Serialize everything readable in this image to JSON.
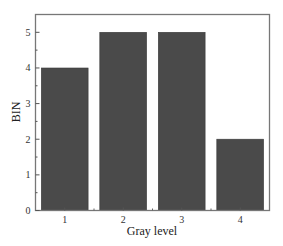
{
  "chart_data": {
    "type": "bar",
    "title": "",
    "xlabel": "Gray level",
    "ylabel": "BIN",
    "categories": [
      "1",
      "2",
      "3",
      "4"
    ],
    "values": [
      4,
      5,
      5,
      2
    ],
    "ylim": [
      0,
      5.5
    ],
    "yticks": [
      0,
      1,
      2,
      3,
      4,
      5
    ],
    "y_minor_step": 0.5,
    "grid": false,
    "legend": null,
    "bar_color": "#4a4a4a",
    "frame_color": "#777777"
  }
}
